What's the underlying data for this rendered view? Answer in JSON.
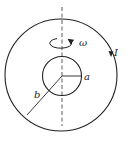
{
  "diagram": {
    "labels": {
      "omega": "ω",
      "current": "I",
      "inner_radius": "a",
      "outer_radius": "b"
    },
    "colors": {
      "stroke": "#222222",
      "background": "#ffffff"
    }
  }
}
